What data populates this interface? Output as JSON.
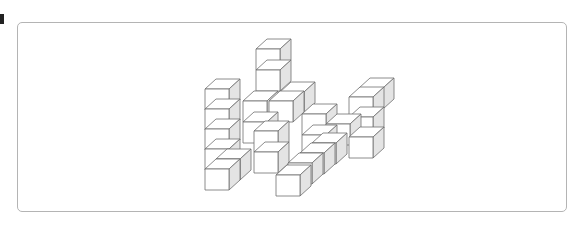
{
  "figure": {
    "title": "",
    "colors": {
      "frame_border": "#b4b4b4",
      "edge": "#6e6e6e",
      "face_light": "#ffffff",
      "face_shaded": "#e4e4e4"
    },
    "cube_geometry": {
      "front_width": 24,
      "front_height": 21,
      "depth_dx": 11,
      "depth_dy": -10
    },
    "cubes": [
      {
        "x": 256,
        "y": 49
      },
      {
        "x": 256,
        "y": 70
      },
      {
        "x": 280,
        "y": 92
      },
      {
        "x": 243,
        "y": 101
      },
      {
        "x": 243,
        "y": 122
      },
      {
        "x": 269,
        "y": 101
      },
      {
        "x": 205,
        "y": 89
      },
      {
        "x": 205,
        "y": 109
      },
      {
        "x": 205,
        "y": 129
      },
      {
        "x": 205,
        "y": 149
      },
      {
        "x": 205,
        "y": 169
      },
      {
        "x": 216,
        "y": 159
      },
      {
        "x": 359,
        "y": 88
      },
      {
        "x": 349,
        "y": 97
      },
      {
        "x": 349,
        "y": 117
      },
      {
        "x": 349,
        "y": 137
      },
      {
        "x": 326,
        "y": 124
      },
      {
        "x": 302,
        "y": 114
      },
      {
        "x": 302,
        "y": 135
      },
      {
        "x": 254,
        "y": 131
      },
      {
        "x": 254,
        "y": 152
      },
      {
        "x": 312,
        "y": 143
      },
      {
        "x": 300,
        "y": 153
      },
      {
        "x": 288,
        "y": 163
      },
      {
        "x": 276,
        "y": 175
      }
    ]
  }
}
